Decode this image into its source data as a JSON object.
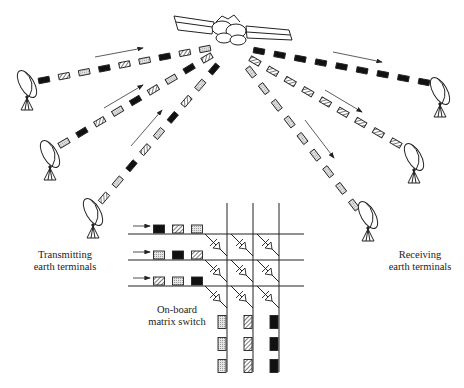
{
  "labels": {
    "transmitting_line1": "Transmitting",
    "transmitting_line2": "earth terminals",
    "receiving_line1": "Receiving",
    "receiving_line2": "earth terminals",
    "switch_line1": "On-board",
    "switch_line2": "matrix switch"
  },
  "packet_types": {
    "A": {
      "name": "black",
      "fill": "#111111"
    },
    "B": {
      "name": "hatched",
      "fill": "hatch"
    },
    "C": {
      "name": "dotted",
      "fill": "#d8d8d8"
    }
  },
  "uplinks": [
    {
      "from": [
        44,
        80
      ],
      "to": [
        205,
        49
      ],
      "packets": [
        "A",
        "B",
        "C",
        "A",
        "B",
        "C",
        "A",
        "B",
        "C"
      ],
      "arrow": [
        [
          95,
          57
        ],
        [
          143,
          48
        ]
      ]
    },
    {
      "from": [
        64,
        143
      ],
      "to": [
        207,
        58
      ],
      "packets": [
        "C",
        "A",
        "B",
        "C",
        "A",
        "B",
        "C",
        "A",
        "B"
      ],
      "arrow": [
        [
          104,
          108
        ],
        [
          143,
          85
        ]
      ]
    },
    {
      "from": [
        104,
        198
      ],
      "to": [
        214,
        69
      ],
      "packets": [
        "B",
        "C",
        "A",
        "B",
        "C",
        "A",
        "B",
        "C",
        "A"
      ],
      "arrow": [
        [
          131,
          146
        ],
        [
          162,
          110
        ]
      ]
    }
  ],
  "downlinks": [
    {
      "from": [
        259,
        51
      ],
      "to": [
        424,
        82
      ],
      "packets": [
        "A",
        "A",
        "A",
        "A",
        "A",
        "A",
        "A",
        "A",
        "A"
      ],
      "arrow": [
        [
          333,
          52
        ],
        [
          382,
          62
        ]
      ]
    },
    {
      "from": [
        255,
        61
      ],
      "to": [
        396,
        143
      ],
      "packets": [
        "B",
        "B",
        "B",
        "B",
        "B",
        "B",
        "B",
        "B",
        "B"
      ],
      "arrow": [
        [
          325,
          90
        ],
        [
          362,
          112
        ]
      ]
    },
    {
      "from": [
        251,
        72
      ],
      "to": [
        354,
        205
      ],
      "packets": [
        "C",
        "C",
        "C",
        "C",
        "C",
        "C",
        "C",
        "C",
        "C"
      ],
      "arrow": [
        [
          305,
          120
        ],
        [
          334,
          158
        ]
      ]
    }
  ],
  "matrix": {
    "rows_y": [
      234,
      260,
      286
    ],
    "cols_x": [
      227,
      253,
      279
    ],
    "row_line_x": [
      128,
      304
    ],
    "col_line_y": [
      203,
      372
    ],
    "input_packets": [
      [
        "A",
        "B",
        "C"
      ],
      [
        "C",
        "A",
        "B"
      ],
      [
        "B",
        "C",
        "A"
      ]
    ],
    "output_packets": [
      [
        "C",
        "C",
        "C"
      ],
      [
        "B",
        "B",
        "B"
      ],
      [
        "A",
        "A",
        "A"
      ]
    ]
  }
}
